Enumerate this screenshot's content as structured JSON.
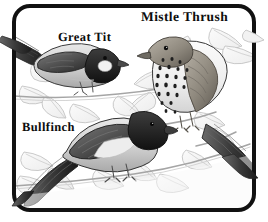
{
  "illustration": {
    "title": "Garden Birds Illustration",
    "style": "grayscale pen-and-ink drawing",
    "background_color": "#ffffff",
    "ink_color": "#0d0d0d",
    "frame": {
      "name": "rounded-rectangle-border",
      "color": "#111111",
      "thickness_px": 4,
      "corner_radius_px": 16,
      "inset": {
        "left": 14,
        "top": 6,
        "right": 14,
        "bottom": 12
      }
    },
    "labels": [
      {
        "id": "mistle-thrush",
        "text": "Mistle Thrush"
      },
      {
        "id": "great-tit",
        "text": "Great Tit"
      },
      {
        "id": "bullfinch",
        "text": "Bullfinch"
      }
    ],
    "birds": [
      {
        "id": "mistle-thrush",
        "common_name": "Mistle Thrush",
        "position": "upper right",
        "facing": "left",
        "features": "heavily spotted pale breast, brown upperparts, long tail crossing the right border",
        "tone": "#8a8a8a"
      },
      {
        "id": "great-tit",
        "common_name": "Great Tit",
        "position": "upper left",
        "facing": "right",
        "features": "dark cap and throat, pale cheek patch, tail extending past the left border",
        "tone": "#909090"
      },
      {
        "id": "bullfinch",
        "common_name": "Bullfinch",
        "position": "lower centre",
        "facing": "right",
        "features": "black cap and face, stubby bill, pale breast, dark wing and tail",
        "tone": "#7d7d7d"
      }
    ],
    "foliage": {
      "description": "outlined leaves and twigs in light grey forming the background",
      "outline_color": "#b8b8b8",
      "fill_color": "#f4f4f4"
    }
  }
}
